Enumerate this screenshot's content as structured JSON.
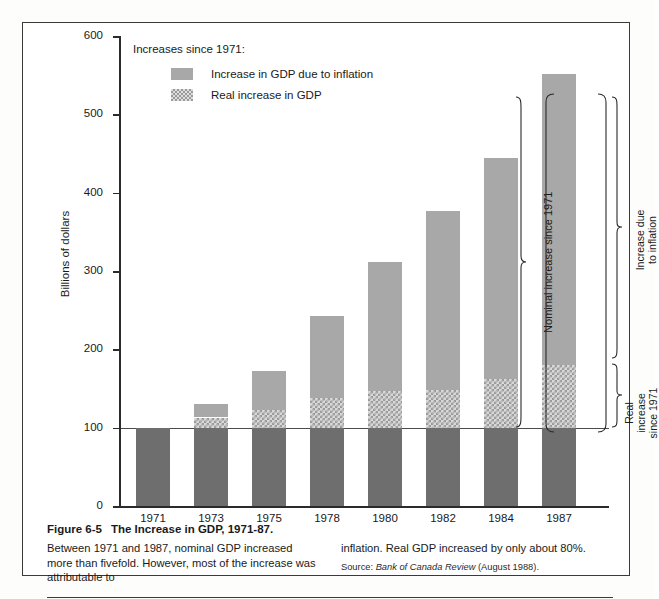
{
  "chart_data": {
    "type": "bar",
    "title": "The Increase in GDP, 1971-87.",
    "xlabel": "",
    "ylabel": "Billions of dollars",
    "ylim": [
      0,
      600
    ],
    "yticks": [
      0,
      100,
      200,
      300,
      400,
      500,
      600
    ],
    "grid": false,
    "legend_position": "top-left",
    "categories": [
      "1971",
      "1973",
      "1975",
      "1978",
      "1980",
      "1982",
      "1984",
      "1987"
    ],
    "stacked": true,
    "reference_line": 100,
    "series": [
      {
        "name": "1971 base level",
        "values": [
          100,
          100,
          100,
          100,
          100,
          100,
          100,
          100
        ]
      },
      {
        "name": "Real increase in GDP",
        "values": [
          0,
          13,
          23,
          38,
          47,
          48,
          62,
          80
        ]
      },
      {
        "name": "Increase in GDP due to inflation",
        "values": [
          0,
          17,
          49,
          104,
          165,
          229,
          282,
          371
        ]
      }
    ],
    "totals": [
      100,
      130,
      172,
      242,
      312,
      377,
      444,
      551
    ],
    "real_tops": [
      100,
      113,
      123,
      138,
      147,
      148,
      162,
      180
    ]
  },
  "legend": {
    "title": "Increases since 1971:",
    "items": [
      {
        "label": "Increase in GDP due to inflation",
        "swatch": "solid-gray",
        "color": "#a8a8a8"
      },
      {
        "label": "Real increase in GDP",
        "swatch": "hatched-gray",
        "color": "#d8d8d8"
      }
    ]
  },
  "axis": {
    "y_label": "Billions of dollars",
    "y_ticks": [
      "600",
      "500",
      "400",
      "300",
      "200",
      "100",
      "0"
    ],
    "x_ticks": [
      "1971",
      "1973",
      "1975",
      "1978",
      "1980",
      "1982",
      "1984",
      "1987"
    ]
  },
  "annotations": {
    "nominal_increase": "Nominal increase since 1971",
    "increase_due_to_inflation": "Increase due\nto inflation",
    "increase_due_to_inflation_line1": "Increase due",
    "increase_due_to_inflation_line2": "to inflation",
    "real_increase_line1": "Real",
    "real_increase_line2": "increase",
    "real_increase_line3": "since 1971"
  },
  "caption": {
    "figure_number": "Figure 6-5",
    "title": "The Increase in GDP, 1971-87.",
    "body_left": "Between 1971 and 1987, nominal GDP increased more than fivefold. However, most of the increase was attributable to",
    "body_right": "inflation. Real GDP increased by only about 80%.",
    "source_prefix": "Source:",
    "source_italic": "Bank of Canada Review",
    "source_suffix": "(August 1988)."
  },
  "colors": {
    "base": "#6e6e6e",
    "inflation": "#a8a8a8",
    "real": "#d8d8d8",
    "axis": "#2b2b2b",
    "frame": "#3a3a3a"
  }
}
